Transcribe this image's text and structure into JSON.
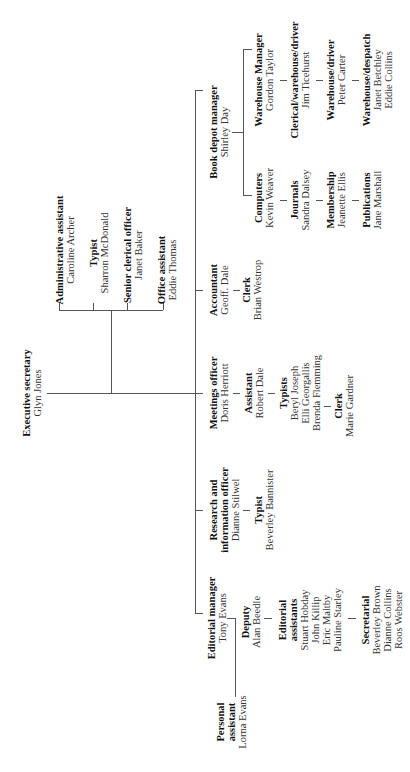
{
  "chart_title": "",
  "orientation": "rotated-90-ccw",
  "nodes": {
    "executive": {
      "role": "Executive secretary",
      "people": [
        "Glyn Jones"
      ]
    },
    "admin_assistant": {
      "role": "Administrative assistant",
      "people": [
        "Caroline Archer"
      ]
    },
    "admin_typist": {
      "role": "Typist",
      "people": [
        "Sharron McDonald"
      ]
    },
    "senior_clerical": {
      "role": "Senior clerical officer",
      "people": [
        "Janet Baker"
      ]
    },
    "office_assistant": {
      "role": "Office assistant",
      "people": [
        "Eddie Thomas"
      ]
    },
    "book_depot": {
      "role": "Book depot manager",
      "people": [
        "Shirley Day"
      ]
    },
    "computers": {
      "role": "Computers",
      "people": [
        "Kevin Weaver"
      ]
    },
    "journals": {
      "role": "Journals",
      "people": [
        "Sandra Dalsey"
      ]
    },
    "membership": {
      "role": "Membership",
      "people": [
        "Jeanette Ellis"
      ]
    },
    "publications": {
      "role": "Publications",
      "people": [
        "Jane Marshall"
      ]
    },
    "warehouse_manager": {
      "role": "Warehouse Manager",
      "people": [
        "Gordon Taylor"
      ]
    },
    "clerical_warehouse_driver": {
      "role": "Clerical/warehouse/driver",
      "people": [
        "Jim Ticehurst"
      ]
    },
    "warehouse_driver": {
      "role": "Warehouse/driver",
      "people": [
        "Peter Carter"
      ]
    },
    "warehouse_despatch": {
      "role": "Warehouse/despatch",
      "people": [
        "Janet Betchley",
        "Eddie Collins"
      ]
    },
    "accountant": {
      "role": "Accountant",
      "people": [
        "Geoff. Dale"
      ]
    },
    "accounts_clerk": {
      "role": "Clerk",
      "people": [
        "Brian Westrop"
      ]
    },
    "meetings_officer": {
      "role": "Meetings officer",
      "people": [
        "Doris Herriott"
      ]
    },
    "meetings_assistant": {
      "role": "Assistant",
      "people": [
        "Robert Dale"
      ]
    },
    "meetings_typists": {
      "role": "Typists",
      "people": [
        "Beryl Joseph",
        "Elli Georgallis",
        "Brenda Flemming"
      ]
    },
    "meetings_clerk": {
      "role": "Clerk",
      "people": [
        "Marie Gardner"
      ]
    },
    "research_officer": {
      "role_lines": [
        "Research and",
        "information officer"
      ],
      "people": [
        "Dianne Stilwel"
      ]
    },
    "research_typist": {
      "role": "Typist",
      "people": [
        "Beverley Bannister"
      ]
    },
    "editorial_manager": {
      "role": "Editorial manager",
      "people": [
        "Tony Evans"
      ]
    },
    "personal_assistant": {
      "role_lines": [
        "Personal",
        "assistant"
      ],
      "people": [
        "Lorna Evans"
      ]
    },
    "deputy": {
      "role": "Deputy",
      "people": [
        "Alan Beedle"
      ]
    },
    "editorial_assistants": {
      "role_lines": [
        "Editorial",
        "assistants"
      ],
      "people": [
        "Stuart Hobday",
        "John Killip",
        "Eric Maltby",
        "Pauline Starley"
      ]
    },
    "secretarial": {
      "role": "Secretarial",
      "people": [
        "Beverley Brown",
        "Dianne Collins",
        "Roos Webster"
      ]
    }
  }
}
